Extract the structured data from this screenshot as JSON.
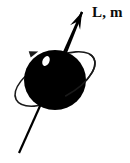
{
  "figure": {
    "kind": "physics-diagram",
    "background_color": "#ffffff",
    "ink_color": "#000000",
    "width": 130,
    "height": 163
  },
  "labels": {
    "angular_momentum": "L, m"
  },
  "body": {
    "name": "particle-sphere",
    "shape": "filled-ellipse",
    "fill_color": "#000000",
    "center_x": 55,
    "center_y": 80,
    "radius_x": 31,
    "radius_y": 30
  },
  "highlight": {
    "name": "sphere-highlight",
    "shape": "filled-ellipse",
    "fill_color": "#ffffff",
    "center_x": 46,
    "center_y": 61,
    "radius_x": 3.4,
    "radius_y": 5.2,
    "rotation_deg": 25
  },
  "spin_axis": {
    "name": "spin-axis-arrow",
    "stroke_color": "#000000",
    "stroke_width": 2.2,
    "tail_x": 19,
    "tail_y": 153,
    "tip_x": 82,
    "tip_y": 12,
    "arrowhead": "filled-triangle",
    "arrowhead_length": 17,
    "arrowhead_half_width": 5.5
  },
  "orbit_ring": {
    "name": "orbit-ring",
    "shape": "tilted-ellipse-outline",
    "stroke_color": "#1a1a1a",
    "stroke_width": 1.6,
    "center_x": 55,
    "center_y": 79,
    "radius_x": 44,
    "radius_y": 20,
    "rotation_deg": -28,
    "direction_arrowhead": {
      "name": "orbit-direction-arrowhead",
      "x": 34,
      "y": 53,
      "rotation_deg": -18,
      "length": 9,
      "half_width": 3.2
    }
  }
}
